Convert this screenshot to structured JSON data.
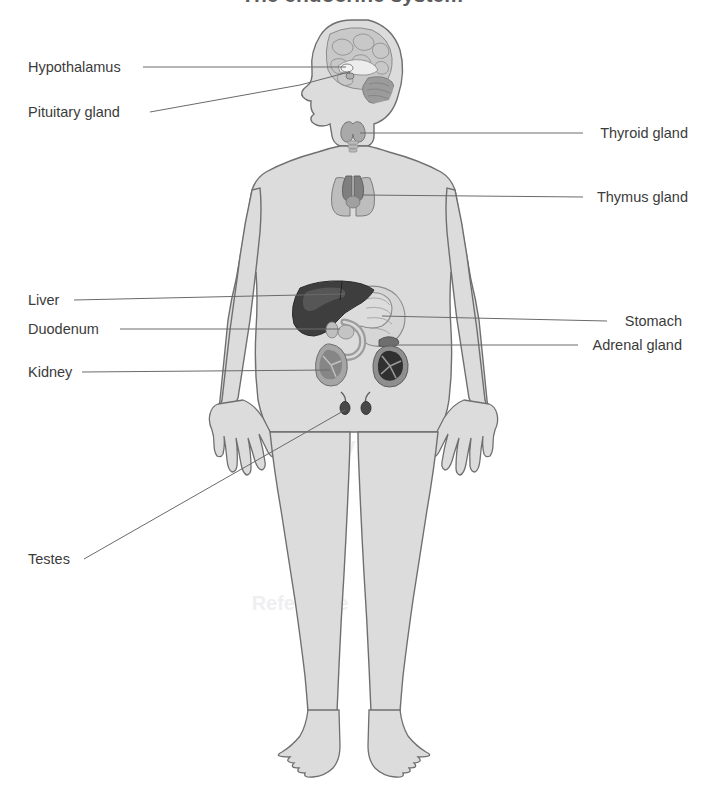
{
  "figure": {
    "title": "The endocrine system",
    "title_clipped": true,
    "background_color": "#ffffff",
    "body_fill": "#dcdcdc",
    "body_outline": "#6f6f6f",
    "leader_color": "#6a6a6a",
    "label_color": "#3b3b3b"
  },
  "watermarks": [
    {
      "text": "Anatomy",
      "x": 300,
      "y": 455,
      "size": 26,
      "color": "#efeff1"
    },
    {
      "text": "Reference",
      "x": 300,
      "y": 610,
      "size": 20,
      "color": "#f2f2f4"
    }
  ],
  "labels": [
    {
      "id": "hypothalamus",
      "text": "Hypothalamus",
      "side": "left",
      "text_x": 28,
      "text_y": 72,
      "leader": "M 143 67 L 346 67",
      "target_x": 346,
      "target_y": 67
    },
    {
      "id": "pituitary-gland",
      "text": "Pituitary gland",
      "side": "left",
      "text_x": 28,
      "text_y": 117,
      "leader": "M 150 112 L 300 85 L 349 72",
      "target_x": 349,
      "target_y": 72
    },
    {
      "id": "thyroid-gland",
      "text": "Thyroid gland",
      "side": "right",
      "text_x": 688,
      "text_y": 138,
      "leader": "M 583 133 L 360 133",
      "target_x": 360,
      "target_y": 133
    },
    {
      "id": "thymus-gland",
      "text": "Thymus gland",
      "side": "right",
      "text_x": 688,
      "text_y": 202,
      "leader": "M 583 197 L 362 195",
      "target_x": 362,
      "target_y": 195
    },
    {
      "id": "liver",
      "text": "Liver",
      "side": "left",
      "text_x": 28,
      "text_y": 305,
      "leader": "M 74 300 L 345 294",
      "target_x": 345,
      "target_y": 294
    },
    {
      "id": "duodenum",
      "text": "Duodenum",
      "side": "left",
      "text_x": 28,
      "text_y": 334,
      "leader": "M 120 329 L 340 329",
      "target_x": 340,
      "target_y": 329
    },
    {
      "id": "kidney",
      "text": "Kidney",
      "side": "left",
      "text_x": 28,
      "text_y": 377,
      "leader": "M 82 372 L 330 370",
      "target_x": 330,
      "target_y": 370
    },
    {
      "id": "stomach",
      "text": "Stomach",
      "side": "right",
      "text_x": 682,
      "text_y": 326,
      "leader": "M 607 321 L 382 316",
      "target_x": 382,
      "target_y": 316
    },
    {
      "id": "adrenal-gland",
      "text": "Adrenal gland",
      "side": "right",
      "text_x": 682,
      "text_y": 350,
      "leader": "M 578 345 L 390 345",
      "target_x": 390,
      "target_y": 345
    },
    {
      "id": "testes",
      "text": "Testes",
      "side": "left",
      "text_x": 28,
      "text_y": 564,
      "leader": "M 84 559 L 345 410",
      "target_x": 345,
      "target_y": 410
    }
  ],
  "organs": [
    {
      "id": "brain",
      "name": "brain",
      "cx": 355,
      "cy": 60,
      "fill": "#c8c8c8"
    },
    {
      "id": "cerebellum",
      "name": "cerebellum",
      "cx": 378,
      "cy": 82,
      "fill": "#9a9a9a"
    },
    {
      "id": "hypothalamus-organ",
      "name": "hypothalamus",
      "cx": 348,
      "cy": 67,
      "fill": "#efefef"
    },
    {
      "id": "pituitary-organ",
      "name": "pituitary-gland",
      "cx": 350,
      "cy": 74,
      "fill": "#b4b4b4"
    },
    {
      "id": "thyroid-organ",
      "name": "thyroid-gland",
      "cx": 353,
      "cy": 131,
      "fill": "#a8a8a8"
    },
    {
      "id": "thymus-organ",
      "name": "thymus-gland",
      "cx": 353,
      "cy": 192,
      "fill": "#8e8e8e"
    },
    {
      "id": "liver-organ",
      "name": "liver",
      "cx": 330,
      "cy": 300,
      "fill": "#3c3c3c"
    },
    {
      "id": "stomach-organ",
      "name": "stomach",
      "cx": 375,
      "cy": 315,
      "fill": "#d2d2d2"
    },
    {
      "id": "duodenum-organ",
      "name": "duodenum",
      "cx": 348,
      "cy": 335,
      "fill": "#b0b0b0"
    },
    {
      "id": "kidney-left-organ",
      "name": "kidney-left",
      "cx": 335,
      "cy": 370,
      "fill": "#8a8a8a"
    },
    {
      "id": "kidney-right-organ",
      "name": "kidney-right",
      "cx": 388,
      "cy": 363,
      "fill": "#3a3a3a"
    },
    {
      "id": "adrenal-organ",
      "name": "adrenal-gland",
      "cx": 390,
      "cy": 341,
      "fill": "#6a6a6a"
    },
    {
      "id": "testis-left-organ",
      "name": "testis-left",
      "cx": 345,
      "cy": 408,
      "fill": "#464646"
    },
    {
      "id": "testis-right-organ",
      "name": "testis-right",
      "cx": 366,
      "cy": 408,
      "fill": "#464646"
    }
  ]
}
